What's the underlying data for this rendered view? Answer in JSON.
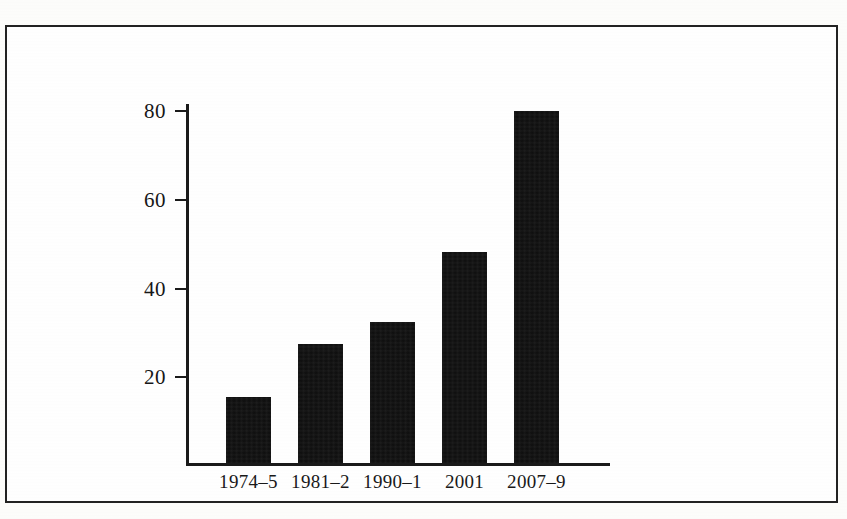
{
  "figure": {
    "background_color": "#ffffff",
    "frame_color": "#222222",
    "axis_color": "#1a1a1a",
    "bar_color": "#0d0d0d"
  },
  "chart_data": {
    "type": "bar",
    "title": "",
    "subtitle": "",
    "xlabel": "",
    "ylabel": "",
    "categories": [
      "1974–5",
      "1981–2",
      "1990–1",
      "2001",
      "2007–9"
    ],
    "values": [
      15,
      27,
      32,
      48,
      80
    ],
    "ylim": [
      0,
      88
    ],
    "yticks": [
      20,
      40,
      60,
      80
    ],
    "ytick_labels": [
      "20",
      "40",
      "60",
      "80"
    ],
    "grid": false,
    "legend": [],
    "legend_position": "none",
    "annotations": []
  }
}
